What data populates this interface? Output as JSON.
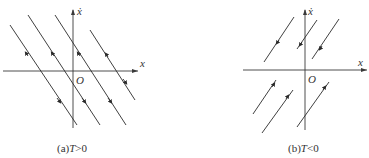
{
  "panels": [
    {
      "id": "a",
      "caption_prefix": "(a)",
      "caption_var": "T",
      "caption_rel": ">0",
      "x_axis_label": "x",
      "y_axis_label": "ẋ",
      "origin_label": "O",
      "trajectory_direction": "down-right slope, arrows upward-left above x-axis, downward-right below x-axis"
    },
    {
      "id": "b",
      "caption_prefix": "(b)",
      "caption_var": "T",
      "caption_rel": "<0",
      "x_axis_label": "x",
      "y_axis_label": "ẋ",
      "origin_label": "O",
      "trajectory_direction": "up-right slope, arrows downward-left above x-axis, upward-right below x-axis"
    }
  ]
}
